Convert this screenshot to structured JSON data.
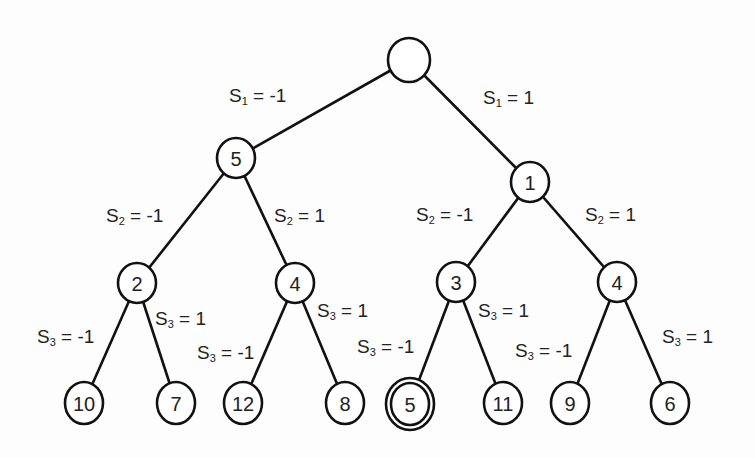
{
  "style": {
    "line_color": "#111111",
    "node_fill": "#ffffff",
    "background": "#fdfdfd"
  },
  "nodes": [
    {
      "id": "root",
      "label": "",
      "x": 409,
      "y": 60,
      "rx": 21,
      "ry": 22,
      "double": false
    },
    {
      "id": "n5",
      "label": "5",
      "x": 236,
      "y": 158,
      "rx": 19,
      "ry": 20,
      "double": false
    },
    {
      "id": "n1",
      "label": "1",
      "x": 530,
      "y": 182,
      "rx": 19,
      "ry": 20,
      "double": false
    },
    {
      "id": "n2",
      "label": "2",
      "x": 137,
      "y": 283,
      "rx": 19,
      "ry": 20,
      "double": false
    },
    {
      "id": "n4a",
      "label": "4",
      "x": 295,
      "y": 283,
      "rx": 19,
      "ry": 20,
      "double": false
    },
    {
      "id": "n3",
      "label": "3",
      "x": 456,
      "y": 282,
      "rx": 19,
      "ry": 20,
      "double": false
    },
    {
      "id": "n4b",
      "label": "4",
      "x": 617,
      "y": 282,
      "rx": 19,
      "ry": 20,
      "double": false
    },
    {
      "id": "l10",
      "label": "10",
      "x": 84,
      "y": 403,
      "rx": 19,
      "ry": 21,
      "double": false
    },
    {
      "id": "l7",
      "label": "7",
      "x": 176,
      "y": 403,
      "rx": 19,
      "ry": 21,
      "double": false
    },
    {
      "id": "l12",
      "label": "12",
      "x": 243,
      "y": 403,
      "rx": 19,
      "ry": 21,
      "double": false
    },
    {
      "id": "l8",
      "label": "8",
      "x": 345,
      "y": 403,
      "rx": 19,
      "ry": 21,
      "double": false
    },
    {
      "id": "l5",
      "label": "5",
      "x": 410,
      "y": 404,
      "rx": 19,
      "ry": 21,
      "double": true
    },
    {
      "id": "l11",
      "label": "11",
      "x": 503,
      "y": 403,
      "rx": 19,
      "ry": 21,
      "double": false
    },
    {
      "id": "l9",
      "label": "9",
      "x": 570,
      "y": 403,
      "rx": 19,
      "ry": 21,
      "double": false
    },
    {
      "id": "l6",
      "label": "6",
      "x": 670,
      "y": 403,
      "rx": 19,
      "ry": 21,
      "double": false
    }
  ],
  "edges": [
    {
      "from": "root",
      "to": "n5",
      "label": {
        "var": "S",
        "sub": "1",
        "val": " = -1",
        "x": 229,
        "y": 102
      }
    },
    {
      "from": "root",
      "to": "n1",
      "label": {
        "var": "S",
        "sub": "1",
        "val": " = 1",
        "x": 483,
        "y": 104
      }
    },
    {
      "from": "n5",
      "to": "n2",
      "label": {
        "var": "S",
        "sub": "2",
        "val": " = -1",
        "x": 106,
        "y": 222
      }
    },
    {
      "from": "n5",
      "to": "n4a",
      "label": {
        "var": "S",
        "sub": "2",
        "val": " = 1",
        "x": 274,
        "y": 222
      }
    },
    {
      "from": "n1",
      "to": "n3",
      "label": {
        "var": "S",
        "sub": "2",
        "val": " = -1",
        "x": 416,
        "y": 221
      }
    },
    {
      "from": "n1",
      "to": "n4b",
      "label": {
        "var": "S",
        "sub": "2",
        "val": " = 1",
        "x": 585,
        "y": 221
      }
    },
    {
      "from": "n2",
      "to": "l10",
      "label": {
        "var": "S",
        "sub": "3",
        "val": " = -1",
        "x": 37,
        "y": 343
      }
    },
    {
      "from": "n2",
      "to": "l7",
      "label": {
        "var": "S",
        "sub": "3",
        "val": " = 1",
        "x": 155,
        "y": 325
      }
    },
    {
      "from": "n4a",
      "to": "l12",
      "label": {
        "var": "S",
        "sub": "3",
        "val": " = -1",
        "x": 197,
        "y": 359
      }
    },
    {
      "from": "n4a",
      "to": "l8",
      "label": {
        "var": "S",
        "sub": "3",
        "val": " = 1",
        "x": 317,
        "y": 317
      }
    },
    {
      "from": "n3",
      "to": "l5",
      "label": {
        "var": "S",
        "sub": "3",
        "val": " = -1",
        "x": 357,
        "y": 353
      }
    },
    {
      "from": "n3",
      "to": "l11",
      "label": {
        "var": "S",
        "sub": "3",
        "val": " = 1",
        "x": 478,
        "y": 317
      }
    },
    {
      "from": "n4b",
      "to": "l9",
      "label": {
        "var": "S",
        "sub": "3",
        "val": " = -1",
        "x": 515,
        "y": 357
      }
    },
    {
      "from": "n4b",
      "to": "l6",
      "label": {
        "var": "S",
        "sub": "3",
        "val": " = 1",
        "x": 662,
        "y": 343
      }
    }
  ]
}
